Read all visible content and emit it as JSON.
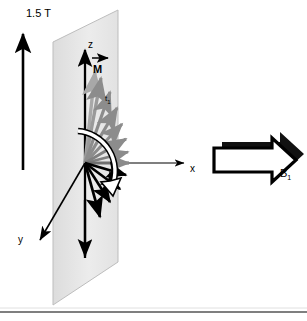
{
  "figure": {
    "background_color": "#ffffff",
    "width": 307,
    "height": 321
  },
  "labels": {
    "field_strength": "1.5 T",
    "axis_z": "z",
    "axis_x": "x",
    "axis_y": "y",
    "magnetization": "M",
    "time_step": "t",
    "time_step_sub": "1",
    "rf_field": "B",
    "rf_field_sub": "1"
  },
  "colors": {
    "stroke": "#000000",
    "plane_fill": "#e9e9e9",
    "plane_edge": "#b4b4b4",
    "grey_vector": "#8c8c8c",
    "grey_vector_light": "#a8a8a8",
    "hollow_fill": "#ffffff",
    "rule": "#555555",
    "background": "#ffffff"
  },
  "elements": {
    "b0_arrow": {
      "name": "static-field-arrow",
      "from": [
        23,
        170
      ],
      "to": [
        23,
        28
      ],
      "label": "1.5 T"
    },
    "plane": {
      "name": "transverse-plane",
      "points": [
        [
          53,
          42
        ],
        [
          118,
          10
        ],
        [
          118,
          262
        ],
        [
          53,
          305
        ]
      ]
    },
    "z_axis": {
      "from": [
        85,
        258
      ],
      "to": [
        85,
        45
      ]
    },
    "x_axis": {
      "from": [
        85,
        163
      ],
      "to": [
        188,
        163
      ]
    },
    "y_axis": {
      "from": [
        85,
        163
      ],
      "to": [
        38,
        243
      ]
    },
    "rotation_arc": {
      "name": "nutation-arc",
      "description": "hollow curved arrow sweeping clockwise from +z toward -z through +x"
    },
    "b1_block_arrow": {
      "name": "rf-field-arrow",
      "description": "hollow right-pointing block arrow with drop shadow"
    },
    "bottom_rule": {
      "y": 312
    }
  },
  "vectors": {
    "grey_upper": [
      {
        "angle_deg": 84,
        "length": 92
      },
      {
        "angle_deg": 74,
        "length": 88
      },
      {
        "angle_deg": 62,
        "length": 80
      },
      {
        "angle_deg": 50,
        "length": 72
      },
      {
        "angle_deg": 38,
        "length": 64
      },
      {
        "angle_deg": 24,
        "length": 56
      },
      {
        "angle_deg": 10,
        "length": 50
      },
      {
        "angle_deg": 0,
        "length": 46
      }
    ],
    "black_lower": [
      {
        "angle_deg": -12,
        "length": 48
      },
      {
        "angle_deg": -26,
        "length": 54
      },
      {
        "angle_deg": -42,
        "length": 62
      },
      {
        "angle_deg": -58,
        "length": 72
      },
      {
        "angle_deg": -75,
        "length": 84
      }
    ]
  }
}
